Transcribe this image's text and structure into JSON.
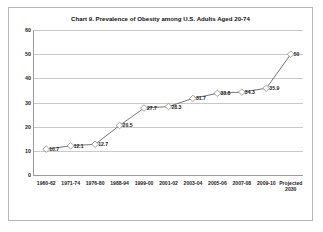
{
  "chart_data": {
    "type": "line",
    "title": "Chart 9. Prevalence of Obesity among U.S. Adults Aged 20-74",
    "xlabel": "",
    "ylabel": "",
    "categories": [
      "1960-62",
      "1971-74",
      "1976-80",
      "1988-94",
      "1999-00",
      "2001-02",
      "2003-04",
      "2005-06",
      "2007-08",
      "2009-10",
      "Projected 2030"
    ],
    "values": [
      10.7,
      12.1,
      12.7,
      20.5,
      27.7,
      28.3,
      31.7,
      33.8,
      34.3,
      35.9,
      50
    ],
    "point_labels": [
      "10.7",
      "12.1",
      "12.7",
      "20.5",
      "27.7",
      "28.3",
      "31.7",
      "33.8",
      "34.3",
      "35.9",
      "50"
    ],
    "yticks": [
      0,
      10,
      20,
      30,
      40,
      50,
      60
    ],
    "ytick_labels": [
      "0",
      "10",
      "20",
      "30",
      "40",
      "50",
      "60"
    ],
    "ylim": [
      0,
      60
    ],
    "grid": true,
    "legend": false,
    "series_color": "#666666",
    "marker": "diamond",
    "marker_color": "#808080"
  }
}
